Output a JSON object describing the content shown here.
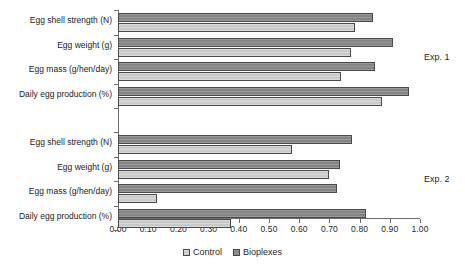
{
  "chart_data": {
    "type": "bar",
    "orientation": "horizontal",
    "title": "",
    "xlabel": "",
    "ylabel": "",
    "xlim": [
      0.0,
      1.0
    ],
    "grid": false,
    "legend_position": "bottom-center",
    "xticks": [
      "0.00",
      "0.10",
      "0.20",
      "0.30",
      "0.40",
      "0.50",
      "0.60",
      "0.70",
      "0.80",
      "0.90",
      "1.00"
    ],
    "xtick_values": [
      0.0,
      0.1,
      0.2,
      0.3,
      0.4,
      0.5,
      0.6,
      0.7,
      0.8,
      0.9,
      1.0
    ],
    "series": [
      {
        "name": "Control",
        "color": "#d2d2d2"
      },
      {
        "name": "Bioplexes",
        "color": "#8d8d8d"
      }
    ],
    "groups": [
      {
        "annotation": "Exp. 1",
        "categories": [
          "Egg shell strength (N)",
          "Egg weight  (g)",
          "Egg mass  (g/hen/day)",
          "Daily egg production (%)"
        ],
        "values": {
          "Control": [
            0.785,
            0.77,
            0.74,
            0.875
          ],
          "Bioplexes": [
            0.845,
            0.91,
            0.85,
            0.965
          ]
        }
      },
      {
        "annotation": "Exp. 2",
        "categories": [
          "Egg shell strength (N)",
          "Egg weight  (g)",
          "Egg mass  (g/hen/day)",
          "Daily egg production (%)"
        ],
        "values": {
          "Control": [
            0.575,
            0.7,
            0.13,
            0.375
          ],
          "Bioplexes": [
            0.775,
            0.735,
            0.725,
            0.82
          ]
        }
      }
    ]
  },
  "legend": {
    "items": [
      {
        "label": "Control",
        "swatch": "control-swatch"
      },
      {
        "label": "Bioplexes",
        "swatch": "bioplexes-swatch"
      }
    ]
  }
}
